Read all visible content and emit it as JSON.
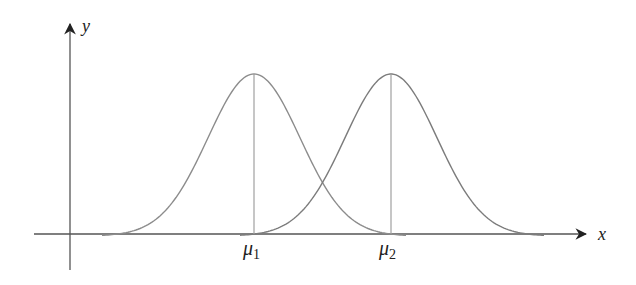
{
  "chart_data": {
    "type": "line",
    "title": "",
    "xlabel": "x",
    "ylabel": "y",
    "grid": false,
    "legend": null,
    "series": [
      {
        "name": "Normal curve 1",
        "mean_label": "μ1",
        "mean": 1,
        "sd": 0.33,
        "color": "#8a8a8a"
      },
      {
        "name": "Normal curve 2",
        "mean_label": "μ2",
        "mean": 2,
        "sd": 0.33,
        "color": "#7a7a7a"
      }
    ],
    "tick_labels": [
      {
        "label": "μ",
        "subscript": "1",
        "position": "mean of curve 1"
      },
      {
        "label": "μ",
        "subscript": "2",
        "position": "mean of curve 2"
      }
    ],
    "annotations": [
      "vertical lines from x-axis to each curve peak at μ1 and μ2"
    ]
  },
  "axes": {
    "x_label": "x",
    "y_label": "y"
  },
  "ticks": {
    "mu1": {
      "symbol": "μ",
      "sub": "1"
    },
    "mu2": {
      "symbol": "μ",
      "sub": "2"
    }
  },
  "colors": {
    "axis": "#444444",
    "curve": "#8c8c8c",
    "mean_line": "#a0a0a0"
  }
}
